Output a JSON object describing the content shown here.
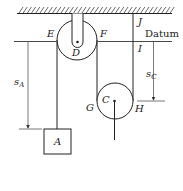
{
  "diagram": {
    "labels": {
      "E": "E",
      "F": "F",
      "D": "D",
      "J": "J",
      "I": "I",
      "datum": "Datum",
      "C": "C",
      "G": "G",
      "H": "H",
      "A": "A",
      "sA_main": "s",
      "sA_sub": "A",
      "sC_main": "s",
      "sC_sub": "C"
    },
    "colors": {
      "line": "#222222",
      "dim_line": "#555555",
      "background": "#ffffff"
    }
  }
}
